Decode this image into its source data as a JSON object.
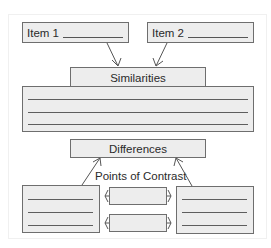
{
  "diagram": {
    "type": "compare-contrast-organizer",
    "items": [
      {
        "label": "Item 1",
        "blank": "____________"
      },
      {
        "label": "Item 2",
        "blank": "____________"
      }
    ],
    "similarities": {
      "title": "Similarities",
      "lines": 3
    },
    "differences": {
      "title": "Differences",
      "points_label": "Points of Contrast",
      "left_box_lines": 3,
      "right_box_lines": 3,
      "contrast_points": 2
    },
    "colors": {
      "stroke": "#6e6e6e",
      "fill": "#ededed",
      "text": "#2a2a2a"
    }
  }
}
